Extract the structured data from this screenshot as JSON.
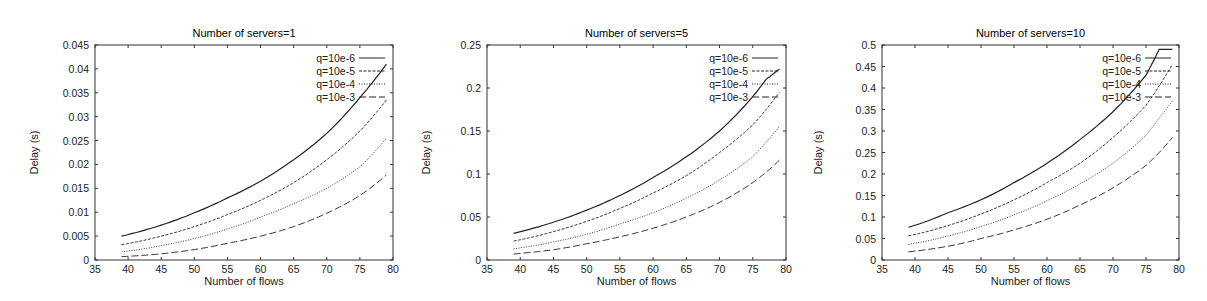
{
  "chart_data": [
    {
      "type": "line",
      "title": "Number of servers=1",
      "xlabel": "Number of flows",
      "ylabel": "Delay (s)",
      "xlim": [
        35,
        80
      ],
      "ylim": [
        0,
        0.045
      ],
      "xticks": [
        "35",
        "40",
        "45",
        "50",
        "55",
        "60",
        "65",
        "70",
        "75",
        "80"
      ],
      "yticks": [
        "0",
        "0.005",
        "0.01",
        "0.015",
        "0.02",
        "0.025",
        "0.03",
        "0.035",
        "0.04",
        "0.045"
      ],
      "grid": false,
      "legend_position": "top-right",
      "x": [
        39,
        45,
        50,
        55,
        60,
        65,
        70,
        75,
        79
      ],
      "series": [
        {
          "name": "q=10e-6",
          "style": "solid",
          "values": [
            0.005,
            0.0073,
            0.0099,
            0.013,
            0.0165,
            0.021,
            0.0265,
            0.034,
            0.041
          ]
        },
        {
          "name": "q=10e-5",
          "style": "dashed",
          "values": [
            0.0032,
            0.005,
            0.007,
            0.0095,
            0.0125,
            0.0162,
            0.021,
            0.027,
            0.0335
          ]
        },
        {
          "name": "q=10e-4",
          "style": "dotted",
          "values": [
            0.0017,
            0.003,
            0.0045,
            0.0065,
            0.009,
            0.0118,
            0.015,
            0.0195,
            0.0255
          ]
        },
        {
          "name": "q=10e-3",
          "style": "long-dash",
          "values": [
            0.0007,
            0.0013,
            0.0022,
            0.0035,
            0.005,
            0.007,
            0.0098,
            0.0135,
            0.0178
          ]
        }
      ]
    },
    {
      "type": "line",
      "title": "Number of servers=5",
      "xlabel": "Number of flows",
      "ylabel": "Delay (s)",
      "xlim": [
        35,
        80
      ],
      "ylim": [
        0,
        0.25
      ],
      "xticks": [
        "35",
        "40",
        "45",
        "50",
        "55",
        "60",
        "65",
        "70",
        "75",
        "80"
      ],
      "yticks": [
        "0",
        "0.05",
        "0.1",
        "0.15",
        "0.2",
        "0.25"
      ],
      "grid": false,
      "legend_position": "top-right",
      "x": [
        39,
        45,
        50,
        55,
        60,
        65,
        70,
        75,
        77,
        79
      ],
      "series": [
        {
          "name": "q=10e-6",
          "style": "solid",
          "values": [
            0.031,
            0.044,
            0.058,
            0.075,
            0.096,
            0.12,
            0.15,
            0.19,
            0.21,
            0.222
          ]
        },
        {
          "name": "q=10e-5",
          "style": "dashed",
          "values": [
            0.022,
            0.033,
            0.045,
            0.06,
            0.078,
            0.098,
            0.125,
            0.157,
            0.175,
            0.195
          ]
        },
        {
          "name": "q=10e-4",
          "style": "dotted",
          "values": [
            0.013,
            0.021,
            0.03,
            0.042,
            0.055,
            0.072,
            0.093,
            0.12,
            0.137,
            0.155
          ]
        },
        {
          "name": "q=10e-3",
          "style": "long-dash",
          "values": [
            0.007,
            0.012,
            0.019,
            0.027,
            0.037,
            0.05,
            0.067,
            0.09,
            0.102,
            0.116
          ]
        }
      ]
    },
    {
      "type": "line",
      "title": "Number of servers=10",
      "xlabel": "Number of flows",
      "ylabel": "Delay (s)",
      "xlim": [
        35,
        80
      ],
      "ylim": [
        0,
        0.5
      ],
      "xticks": [
        "35",
        "40",
        "45",
        "50",
        "55",
        "60",
        "65",
        "70",
        "75",
        "80"
      ],
      "yticks": [
        "0",
        "0.05",
        "0.1",
        "0.15",
        "0.2",
        "0.25",
        "0.3",
        "0.35",
        "0.4",
        "0.45",
        "0.5"
      ],
      "grid": false,
      "legend_position": "top-right",
      "x": [
        39,
        45,
        50,
        55,
        60,
        65,
        70,
        75,
        77,
        79
      ],
      "series": [
        {
          "name": "q=10e-6",
          "style": "solid",
          "values": [
            0.076,
            0.11,
            0.14,
            0.18,
            0.225,
            0.28,
            0.345,
            0.43,
            0.49,
            0.49
          ]
        },
        {
          "name": "q=10e-5",
          "style": "dashed",
          "values": [
            0.056,
            0.08,
            0.107,
            0.14,
            0.18,
            0.225,
            0.285,
            0.36,
            0.405,
            0.455
          ]
        },
        {
          "name": "q=10e-4",
          "style": "dotted",
          "values": [
            0.036,
            0.056,
            0.078,
            0.105,
            0.138,
            0.177,
            0.225,
            0.29,
            0.33,
            0.37
          ]
        },
        {
          "name": "q=10e-3",
          "style": "long-dash",
          "values": [
            0.019,
            0.032,
            0.05,
            0.07,
            0.095,
            0.128,
            0.168,
            0.22,
            0.25,
            0.285
          ]
        }
      ]
    }
  ]
}
